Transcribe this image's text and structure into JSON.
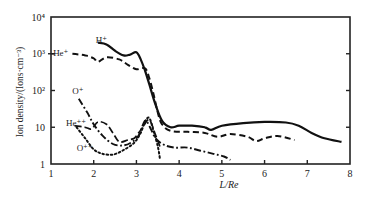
{
  "chart_data": {
    "type": "line",
    "title": "",
    "xlabel": "L/Re",
    "ylabel": "Ion density/(Ions·cm⁻³)",
    "xlim": [
      1,
      8
    ],
    "ylim": [
      1,
      10000
    ],
    "yscale": "log",
    "grid": false,
    "legend": "inline labels",
    "x_ticks": [
      1,
      2,
      3,
      4,
      5,
      6,
      7,
      8
    ],
    "x_tick_labels": [
      "1",
      "2",
      "3",
      "4",
      "5",
      "6",
      "7",
      "8"
    ],
    "y_ticks": [
      1,
      10,
      100,
      1000,
      10000
    ],
    "y_tick_labels": [
      "1",
      "10",
      "10²",
      "10³",
      "10⁴"
    ],
    "series": [
      {
        "name": "H⁺",
        "style": "solid",
        "label_pos": [
          2.05,
          2300
        ],
        "points": [
          [
            2.1,
            2000
          ],
          [
            2.3,
            1800
          ],
          [
            2.5,
            1200
          ],
          [
            2.7,
            900
          ],
          [
            2.85,
            950
          ],
          [
            3.0,
            1100
          ],
          [
            3.1,
            700
          ],
          [
            3.2,
            350
          ],
          [
            3.3,
            150
          ],
          [
            3.45,
            40
          ],
          [
            3.6,
            15
          ],
          [
            3.8,
            10
          ],
          [
            4.0,
            11
          ],
          [
            4.3,
            11
          ],
          [
            4.6,
            10
          ],
          [
            4.75,
            8.5
          ],
          [
            5.0,
            11
          ],
          [
            5.5,
            13
          ],
          [
            6.0,
            14
          ],
          [
            6.5,
            13.5
          ],
          [
            6.8,
            11
          ],
          [
            7.1,
            7
          ],
          [
            7.4,
            5
          ],
          [
            7.8,
            4
          ]
        ]
      },
      {
        "name": "He⁺",
        "style": "dashed",
        "label_pos": [
          1.05,
          1050
        ],
        "points": [
          [
            1.5,
            1000
          ],
          [
            1.8,
            900
          ],
          [
            2.0,
            750
          ],
          [
            2.1,
            600
          ],
          [
            2.3,
            800
          ],
          [
            2.6,
            700
          ],
          [
            2.8,
            500
          ],
          [
            3.0,
            380
          ],
          [
            3.2,
            400
          ],
          [
            3.3,
            220
          ],
          [
            3.4,
            80
          ],
          [
            3.5,
            25
          ],
          [
            3.6,
            12
          ],
          [
            3.8,
            8
          ],
          [
            4.2,
            7.5
          ],
          [
            4.6,
            7
          ],
          [
            4.9,
            5.5
          ],
          [
            5.2,
            6.5
          ],
          [
            5.6,
            5.5
          ],
          [
            5.8,
            4.2
          ],
          [
            6.0,
            5
          ],
          [
            6.3,
            5.8
          ],
          [
            6.7,
            4.5
          ]
        ]
      },
      {
        "name": "O⁺",
        "style": "dashdot",
        "label_pos": [
          1.5,
          95
        ],
        "points": [
          [
            1.65,
            60
          ],
          [
            1.85,
            25
          ],
          [
            2.0,
            12
          ],
          [
            2.2,
            6
          ],
          [
            2.45,
            3.5
          ],
          [
            2.7,
            3.2
          ],
          [
            2.9,
            4
          ],
          [
            3.05,
            6
          ],
          [
            3.2,
            15
          ],
          [
            3.3,
            11
          ],
          [
            3.45,
            5
          ],
          [
            3.65,
            3.3
          ],
          [
            3.9,
            2.8
          ],
          [
            4.2,
            2.8
          ],
          [
            4.5,
            2.3
          ],
          [
            4.8,
            1.9
          ],
          [
            5.05,
            1.6
          ],
          [
            5.2,
            1.3
          ]
        ]
      },
      {
        "name": "He⁺⁺",
        "style": "longdash",
        "label_pos": [
          1.35,
          13
        ],
        "points": [
          [
            1.55,
            11
          ],
          [
            1.8,
            10
          ],
          [
            1.95,
            9
          ],
          [
            2.1,
            14
          ],
          [
            2.3,
            12
          ],
          [
            2.45,
            7
          ],
          [
            2.6,
            4
          ],
          [
            2.8,
            4.5
          ],
          [
            2.95,
            5
          ],
          [
            3.05,
            7
          ],
          [
            3.15,
            10
          ],
          [
            3.3,
            16
          ],
          [
            3.45,
            6
          ],
          [
            3.55,
            3
          ]
        ]
      },
      {
        "name": "O⁺⁺",
        "style": "dotted",
        "label_pos": [
          1.6,
          2.7
        ],
        "points": [
          [
            1.6,
            10
          ],
          [
            1.8,
            5
          ],
          [
            2.0,
            2.5
          ],
          [
            2.2,
            1.9
          ],
          [
            2.45,
            1.8
          ],
          [
            2.7,
            2.4
          ],
          [
            2.95,
            3.8
          ],
          [
            3.1,
            7
          ],
          [
            3.2,
            14
          ],
          [
            3.3,
            18
          ],
          [
            3.4,
            8
          ],
          [
            3.5,
            3
          ],
          [
            3.55,
            1.4
          ]
        ]
      }
    ]
  }
}
